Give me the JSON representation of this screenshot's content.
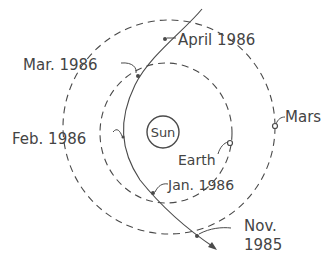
{
  "diagram": {
    "colors": {
      "line": "#4a4a4a",
      "text": "#444444",
      "background": "#ffffff"
    },
    "sun": {
      "label": "Sun"
    },
    "planets": [
      {
        "name": "Earth",
        "label": "Earth"
      },
      {
        "name": "Mars",
        "label": "Mars"
      }
    ],
    "comet_path_labels": [
      {
        "date": "April 1986"
      },
      {
        "date": "Mar. 1986"
      },
      {
        "date": "Feb. 1986"
      },
      {
        "date": "Jan. 1986"
      },
      {
        "date_line1": "Nov.",
        "date_line2": "1985"
      }
    ]
  }
}
